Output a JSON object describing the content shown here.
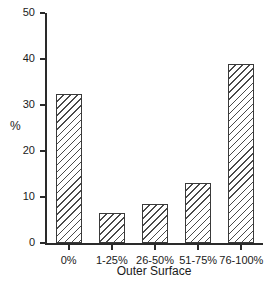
{
  "chart_data": {
    "type": "bar",
    "title": "",
    "categories": [
      "0%",
      "1-25%",
      "26-50%",
      "51-75%",
      "76-100%"
    ],
    "values": [
      32.5,
      6.5,
      8.5,
      13,
      39
    ],
    "xlabel": "Outer Surface",
    "ylabel": "%",
    "ylim": [
      0,
      50
    ],
    "yticks": [
      0,
      10,
      20,
      30,
      40,
      50
    ],
    "grid": false,
    "legend": "none",
    "bar_style": "diagonal-hatch",
    "colors": {
      "background": "#ffffff",
      "axis": "#2a2a2a",
      "text": "#1a1a1a",
      "bar_fill": "#ffffff",
      "hatch_line": "#4a4a4a",
      "bar_border": "#3a3a3a"
    }
  }
}
